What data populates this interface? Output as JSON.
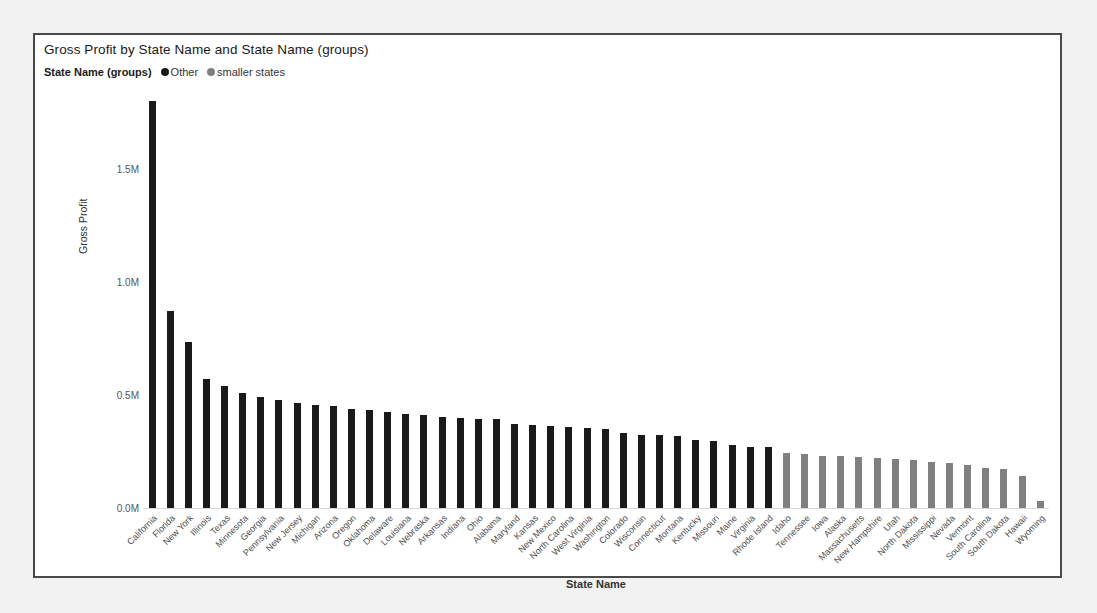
{
  "chart": {
    "title": "Gross Profit by State Name and State Name (groups)",
    "xlabel": "State Name",
    "ylabel": "Gross Profit"
  },
  "legend": {
    "title": "State Name (groups)",
    "entries": [
      {
        "label": "Other",
        "color": "#1a1a1a"
      },
      {
        "label": "smaller states",
        "color": "#808080"
      }
    ]
  },
  "chart_data": {
    "type": "bar",
    "title": "Gross Profit by State Name and State Name (groups)",
    "xlabel": "State Name",
    "ylabel": "Gross Profit",
    "ylim": [
      0,
      1850000
    ],
    "ytick_labels": [
      "0.0M",
      "0.5M",
      "1.0M",
      "1.5M"
    ],
    "ytick_values": [
      0,
      500000,
      1000000,
      1500000
    ],
    "grid": false,
    "legend_position": "top-left",
    "group_colors": {
      "Other": "#1a1a1a",
      "smaller states": "#808080"
    },
    "categories": [
      "California",
      "Florida",
      "New York",
      "Illinois",
      "Texas",
      "Minnesota",
      "Georgia",
      "Pennsylvania",
      "New Jersey",
      "Michigan",
      "Arizona",
      "Oregon",
      "Oklahoma",
      "Delaware",
      "Louisiana",
      "Nebraska",
      "Arkansas",
      "Indiana",
      "Ohio",
      "Alabama",
      "Maryland",
      "Kansas",
      "New Mexico",
      "North Carolina",
      "West Virginia",
      "Washington",
      "Colorado",
      "Wisconsin",
      "Connecticut",
      "Montana",
      "Kentucky",
      "Missouri",
      "Maine",
      "Virginia",
      "Rhode Island",
      "Idaho",
      "Tennessee",
      "Iowa",
      "Alaska",
      "Massachusetts",
      "New Hampshire",
      "Utah",
      "North Dakota",
      "Mississippi",
      "Nevada",
      "Vermont",
      "South Carolina",
      "South Dakota",
      "Hawaii",
      "Wyoming"
    ],
    "values": [
      1800000,
      870000,
      735000,
      570000,
      540000,
      510000,
      492000,
      480000,
      465000,
      455000,
      450000,
      440000,
      432000,
      424000,
      418000,
      412000,
      405000,
      400000,
      396000,
      392000,
      370000,
      366000,
      362000,
      358000,
      352000,
      348000,
      330000,
      325000,
      322000,
      318000,
      300000,
      295000,
      278000,
      272000,
      268000,
      242000,
      240000,
      232000,
      228000,
      225000,
      222000,
      216000,
      212000,
      205000,
      200000,
      190000,
      178000,
      172000,
      140000,
      32000
    ],
    "groups": [
      "Other",
      "Other",
      "Other",
      "Other",
      "Other",
      "Other",
      "Other",
      "Other",
      "Other",
      "Other",
      "Other",
      "Other",
      "Other",
      "Other",
      "Other",
      "Other",
      "Other",
      "Other",
      "Other",
      "Other",
      "Other",
      "Other",
      "Other",
      "Other",
      "Other",
      "Other",
      "Other",
      "Other",
      "Other",
      "Other",
      "Other",
      "Other",
      "Other",
      "Other",
      "Other",
      "smaller states",
      "smaller states",
      "smaller states",
      "smaller states",
      "smaller states",
      "smaller states",
      "smaller states",
      "smaller states",
      "smaller states",
      "smaller states",
      "smaller states",
      "smaller states",
      "smaller states",
      "smaller states",
      "smaller states"
    ]
  }
}
